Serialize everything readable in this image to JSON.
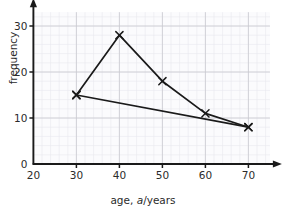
{
  "chart_data": {
    "type": "line",
    "title": "",
    "xlabel": "age, a/years",
    "xlabel_prefix": "age, ",
    "xlabel_var": "a",
    "xlabel_suffix": "/years",
    "ylabel": "frequency",
    "xlim": [
      20,
      75
    ],
    "ylim": [
      0,
      33
    ],
    "xticks": [
      20,
      30,
      40,
      50,
      60,
      70
    ],
    "yticks": [
      0,
      10,
      20,
      30
    ],
    "xtick_labels": [
      "20",
      "30",
      "40",
      "50",
      "60",
      "70"
    ],
    "ytick_labels": [
      "0",
      "10",
      "20",
      "30"
    ],
    "grid": true,
    "grid_major_step_x": 10,
    "grid_major_step_y": 10,
    "grid_minor_step_x": 2,
    "grid_minor_step_y": 2,
    "legend": "none",
    "marker": "x-cross",
    "series": [
      {
        "name": "series-1",
        "x": [
          30,
          40,
          50,
          60,
          70
        ],
        "values": [
          15,
          28,
          18,
          11,
          8
        ],
        "color": "#1a1a1a"
      },
      {
        "name": "series-2",
        "x": [
          30,
          70
        ],
        "values": [
          15,
          8
        ],
        "color": "#1a1a1a"
      }
    ],
    "colors": {
      "axis": "#1a1a1a",
      "grid_major": "#c9c9cf",
      "grid_minor": "#e8e8ee",
      "text": "#2b2b2b",
      "plot_background": "#fbfbfd",
      "line": "#1a1a1a"
    }
  }
}
